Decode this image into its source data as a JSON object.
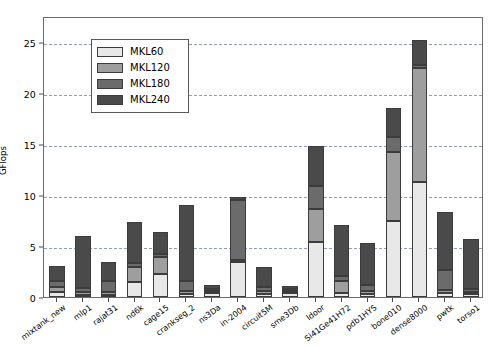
{
  "chart_data": {
    "type": "bar",
    "stacked": true,
    "title": "",
    "xlabel": "",
    "ylabel": "GFlops",
    "ylim": [
      0,
      27.5
    ],
    "yticks": [
      0,
      5,
      10,
      15,
      20,
      25
    ],
    "ytick_labels": [
      "0",
      "5",
      "10",
      "15",
      "20",
      "25"
    ],
    "grid": "horizontal-dashed",
    "legend_position": "upper-left",
    "colors": {
      "MKL60": "#e8e8e8",
      "MKL120": "#9e9e9e",
      "MKL180": "#6b6b6b",
      "MKL240": "#4a4a4a"
    },
    "categories": [
      "mixtank_new",
      "mlp1",
      "rajat31",
      "nd6k",
      "cage15",
      "crankseg_2",
      "ns3Da",
      "in-2004",
      "circuit5M",
      "sme3Db",
      "ldoor",
      "Si41Ge41H72",
      "pdb1HYS",
      "bone010",
      "dense8000",
      "pwtk",
      "torso1"
    ],
    "series": [
      {
        "name": "MKL60",
        "values": [
          0.5,
          0.2,
          0.2,
          1.5,
          2.3,
          0.3,
          0.4,
          3.4,
          0.3,
          0.4,
          5.4,
          0.4,
          0.3,
          7.4,
          11.3,
          0.4,
          0.3
        ]
      },
      {
        "name": "MKL120",
        "values": [
          0.5,
          0.3,
          0.3,
          1.4,
          1.6,
          0.3,
          0.2,
          0.2,
          0.3,
          0.2,
          3.2,
          1.2,
          0.3,
          6.8,
          11.1,
          0.3,
          0.2
        ]
      },
      {
        "name": "MKL180",
        "values": [
          0.6,
          0.4,
          1.1,
          0.4,
          0.3,
          1.0,
          0.2,
          5.9,
          0.4,
          0.2,
          2.3,
          0.5,
          0.6,
          1.5,
          0.3,
          1.9,
          0.3
        ]
      },
      {
        "name": "MKL240",
        "values": [
          1.4,
          5.1,
          1.8,
          4.0,
          2.2,
          7.4,
          0.4,
          0.3,
          1.9,
          0.3,
          3.9,
          4.9,
          4.1,
          2.8,
          2.5,
          5.7,
          4.9
        ]
      }
    ],
    "totals": [
      3.0,
      6.0,
      3.4,
      7.3,
      6.4,
      9.0,
      1.2,
      9.8,
      2.9,
      1.1,
      14.8,
      7.0,
      5.3,
      18.5,
      25.2,
      8.3,
      5.7
    ]
  },
  "legend": {
    "entries": [
      {
        "label": "MKL60",
        "color": "#e8e8e8"
      },
      {
        "label": "MKL120",
        "color": "#9e9e9e"
      },
      {
        "label": "MKL180",
        "color": "#6b6b6b"
      },
      {
        "label": "MKL240",
        "color": "#4a4a4a"
      }
    ]
  }
}
